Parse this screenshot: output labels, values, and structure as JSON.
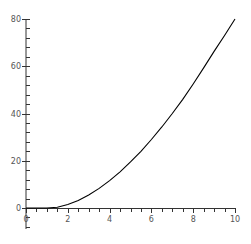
{
  "chart_data": {
    "type": "line",
    "title": "",
    "xlabel": "",
    "ylabel": "",
    "xlim": [
      0,
      10
    ],
    "ylim": [
      0,
      80
    ],
    "grid": false,
    "legend": null,
    "x_ticks": [
      0,
      2,
      4,
      6,
      8,
      10
    ],
    "x_tick_labels": [
      "0",
      "2",
      "4",
      "6",
      "8",
      "10"
    ],
    "y_ticks": [
      0,
      20,
      40,
      60,
      80
    ],
    "y_tick_labels": [
      "0",
      "20",
      "40",
      "60",
      "80"
    ],
    "series": [
      {
        "name": "curve",
        "color": "#000000",
        "x": [
          0,
          0.5,
          1,
          1.5,
          2,
          2.5,
          3,
          3.5,
          4,
          4.5,
          5,
          5.5,
          6,
          6.5,
          7,
          7.5,
          8,
          8.5,
          9,
          9.5,
          10
        ],
        "y": [
          0,
          0,
          0,
          0.3,
          1.5,
          3.2,
          5.5,
          8.3,
          11.6,
          15.3,
          19.5,
          24,
          29,
          34.3,
          40,
          46,
          52.5,
          59.3,
          66.3,
          73,
          80
        ]
      }
    ]
  },
  "axes": {
    "x_tick_labels": [
      "0",
      "2",
      "4",
      "6",
      "8",
      "10"
    ],
    "y_tick_labels": [
      "0",
      "20",
      "40",
      "60",
      "80"
    ]
  }
}
